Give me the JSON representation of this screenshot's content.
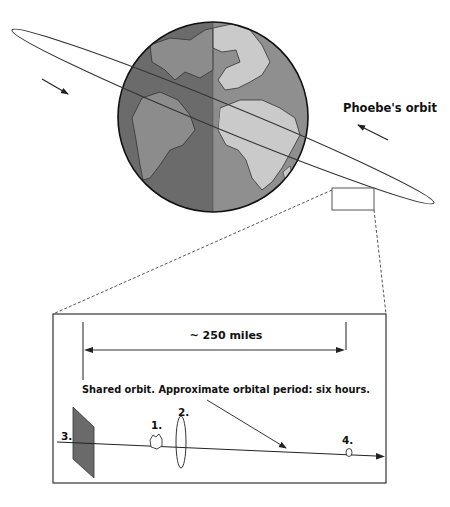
{
  "colors": {
    "stroke": "#222222",
    "ocean_night": "#6b6b6b",
    "ocean_day": "#8f8f8f",
    "land_night": "#8c8c8c",
    "land_day": "#cacaca",
    "debris_panel": "#6a6a6a",
    "box_stroke": "#555555"
  },
  "overview": {
    "orbit_label": "Phoebe's orbit",
    "globe": "earth-globe"
  },
  "inset": {
    "distance_label": "~ 250 miles",
    "caption": "Shared orbit. Approximate orbital period: six hours.",
    "objects": [
      {
        "id": "1",
        "label": "1."
      },
      {
        "id": "2",
        "label": "2."
      },
      {
        "id": "3",
        "label": "3."
      },
      {
        "id": "4",
        "label": "4."
      }
    ]
  }
}
